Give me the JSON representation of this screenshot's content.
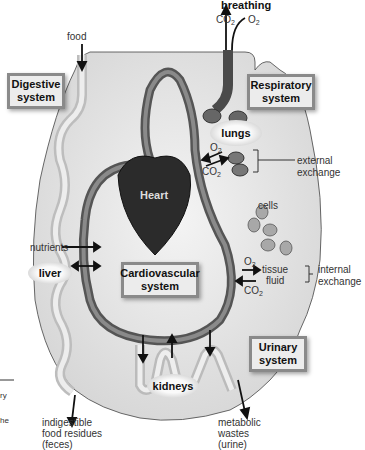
{
  "diagram": {
    "top_labels": {
      "breathing": "breathing",
      "co2": "CO",
      "o2": "O",
      "sub2": "2",
      "food": "food"
    },
    "systems": {
      "digestive": [
        "Digestive",
        "system"
      ],
      "respiratory": [
        "Respiratory",
        "system"
      ],
      "cardiovascular": [
        "Cardiovascular",
        "system"
      ],
      "urinary": [
        "Urinary",
        "system"
      ]
    },
    "organs": {
      "lungs": "lungs",
      "heart": "Heart",
      "liver": "liver",
      "kidneys": "kidneys"
    },
    "labels": {
      "external_exchange": [
        "external",
        "exchange"
      ],
      "internal_exchange": [
        "internal",
        "exchange"
      ],
      "cells": "cells",
      "tissue_fluid": [
        "tissue",
        "fluid"
      ],
      "nutrients": "nutrients",
      "feces": [
        "indigestible",
        "food residues",
        "(feces)"
      ],
      "urine": [
        "metabolic",
        "wastes",
        "(urine)"
      ],
      "lung_o2": "O",
      "lung_co2": "CO",
      "tissue_o2": "O",
      "tissue_co2": "CO"
    },
    "cutoff_text": [
      "ry",
      "he"
    ]
  }
}
